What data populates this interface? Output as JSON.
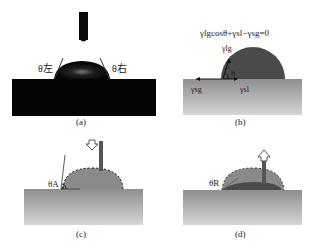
{
  "figure": {
    "panels": [
      {
        "id": "a",
        "caption": "(a)",
        "labels": {
          "left_angle": "θ左",
          "right_angle": "θ右"
        }
      },
      {
        "id": "b",
        "caption": "(b)",
        "equation": "γlgcosθ+γsl−γsg=0",
        "labels": {
          "gamma_lg": "γlg",
          "gamma_sg": "γsg",
          "gamma_sl": "γsl",
          "theta": "θ"
        }
      },
      {
        "id": "c",
        "caption": "(c)",
        "labels": {
          "advancing_angle": "θA"
        }
      },
      {
        "id": "d",
        "caption": "(d)",
        "labels": {
          "receding_angle": "θR"
        }
      }
    ],
    "colors": {
      "photo_substrate": "#050505",
      "droplet_dark": "#4a4a4a",
      "droplet_light": "#8a8a8a",
      "substrate_top": "#8c8c8c",
      "substrate_bottom": "#d4d4d4"
    }
  }
}
